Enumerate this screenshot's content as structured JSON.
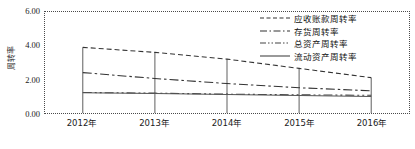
{
  "chart_data": {
    "type": "line",
    "title": "",
    "xlabel": "",
    "ylabel": "周转率",
    "categories": [
      "2012年",
      "2013年",
      "2014年",
      "2015年",
      "2016年"
    ],
    "ylim": [
      0.0,
      6.0
    ],
    "yticks": [
      "0.00",
      "2.00",
      "4.00",
      "6.00"
    ],
    "ytick_values": [
      0.0,
      2.0,
      4.0,
      6.0
    ],
    "grid": "vertical-gridlines-at-category-ticks",
    "legend_position": "top-right inside plot",
    "series": [
      {
        "name": "应收账款周转率",
        "style": "dashed",
        "color": "#333333",
        "values": [
          3.9,
          3.6,
          3.2,
          2.65,
          2.1
        ]
      },
      {
        "name": "存货周转率",
        "style": "dash-dot",
        "color": "#333333",
        "values": [
          2.4,
          2.05,
          1.75,
          1.5,
          1.32
        ]
      },
      {
        "name": "总资产周转率",
        "style": "dash-dot-dot",
        "color": "#444444",
        "values": [
          1.22,
          1.18,
          1.12,
          1.08,
          1.05
        ]
      },
      {
        "name": "流动资产周转率",
        "style": "solid",
        "color": "#555555",
        "values": [
          1.2,
          1.16,
          1.1,
          1.04,
          0.98
        ]
      }
    ]
  },
  "legend": {
    "items": [
      {
        "label": "应收账款周转率"
      },
      {
        "label": "存货周转率"
      },
      {
        "label": "总资产周转率"
      },
      {
        "label": "流动资产周转率"
      }
    ]
  }
}
